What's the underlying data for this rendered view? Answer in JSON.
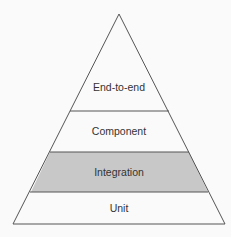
{
  "diagram": {
    "type": "test-pyramid",
    "layers": [
      {
        "label": "End-to-end",
        "fill": "#fafafa"
      },
      {
        "label": "Component",
        "fill": "#fafafa"
      },
      {
        "label": "Integration",
        "fill": "#c8c8c8"
      },
      {
        "label": "Unit",
        "fill": "#fafafa"
      }
    ],
    "colors": {
      "stroke": "#555555",
      "highlight": "#c8c8c8",
      "background": "#fafafa"
    }
  }
}
